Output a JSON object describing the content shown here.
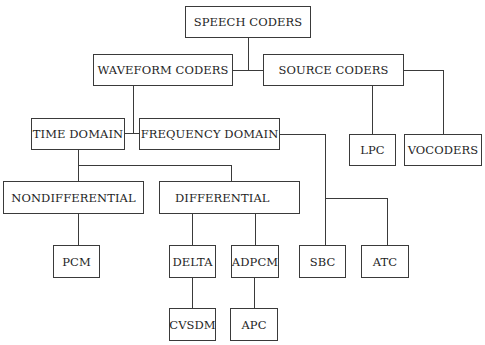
{
  "diagram": {
    "root": "SPEECH CODERS",
    "nodes": {
      "speech_coders": "SPEECH CODERS",
      "waveform_coders": "WAVEFORM CODERS",
      "source_coders": "SOURCE CODERS",
      "time_domain": "TIME DOMAIN",
      "frequency_domain": "FREQUENCY DOMAIN",
      "lpc": "LPC",
      "vocoders": "VOCODERS",
      "nondifferential": "NONDIFFERENTIAL",
      "differential": "DIFFERENTIAL",
      "pcm": "PCM",
      "delta": "DELTA",
      "adpcm": "ADPCM",
      "sbc": "SBC",
      "atc": "ATC",
      "cvsdm": "CVSDM",
      "apc": "APC"
    },
    "edges": [
      [
        "SPEECH CODERS",
        "WAVEFORM CODERS"
      ],
      [
        "SPEECH CODERS",
        "SOURCE CODERS"
      ],
      [
        "SOURCE CODERS",
        "LPC"
      ],
      [
        "SOURCE CODERS",
        "VOCODERS"
      ],
      [
        "WAVEFORM CODERS",
        "TIME DOMAIN"
      ],
      [
        "WAVEFORM CODERS",
        "FREQUENCY DOMAIN"
      ],
      [
        "TIME DOMAIN",
        "NONDIFFERENTIAL"
      ],
      [
        "TIME DOMAIN",
        "DIFFERENTIAL"
      ],
      [
        "FREQUENCY DOMAIN",
        "SBC"
      ],
      [
        "FREQUENCY DOMAIN",
        "ATC"
      ],
      [
        "NONDIFFERENTIAL",
        "PCM"
      ],
      [
        "DIFFERENTIAL",
        "DELTA"
      ],
      [
        "DIFFERENTIAL",
        "ADPCM"
      ],
      [
        "DELTA",
        "CVSDM"
      ],
      [
        "ADPCM",
        "APC"
      ]
    ]
  }
}
